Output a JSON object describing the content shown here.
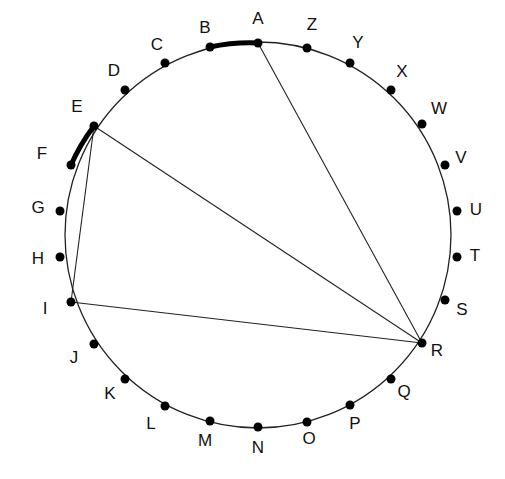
{
  "diagram": {
    "type": "circle-points-chords",
    "circle": {
      "cx": 258,
      "cy": 235,
      "r": 193,
      "stroke": "#222222"
    },
    "points": [
      {
        "label": "A",
        "x": 258,
        "y": 43,
        "lx": 258,
        "ly": 20
      },
      {
        "label": "Z",
        "x": 307,
        "y": 48,
        "lx": 312,
        "ly": 26
      },
      {
        "label": "Y",
        "x": 350,
        "y": 63,
        "lx": 358,
        "ly": 44
      },
      {
        "label": "X",
        "x": 391,
        "y": 90,
        "lx": 402,
        "ly": 73
      },
      {
        "label": "W",
        "x": 422,
        "y": 124,
        "lx": 439,
        "ly": 110
      },
      {
        "label": "V",
        "x": 445,
        "y": 165,
        "lx": 461,
        "ly": 159
      },
      {
        "label": "U",
        "x": 457,
        "y": 211,
        "lx": 476,
        "ly": 211
      },
      {
        "label": "T",
        "x": 457,
        "y": 257,
        "lx": 475,
        "ly": 257
      },
      {
        "label": "S",
        "x": 445,
        "y": 300,
        "lx": 462,
        "ly": 311
      },
      {
        "label": "R",
        "x": 422,
        "y": 343,
        "lx": 437,
        "ly": 352
      },
      {
        "label": "Q",
        "x": 391,
        "y": 379,
        "lx": 404,
        "ly": 393
      },
      {
        "label": "P",
        "x": 350,
        "y": 405,
        "lx": 355,
        "ly": 425
      },
      {
        "label": "O",
        "x": 307,
        "y": 422,
        "lx": 309,
        "ly": 440
      },
      {
        "label": "N",
        "x": 258,
        "y": 427,
        "lx": 258,
        "ly": 449
      },
      {
        "label": "M",
        "x": 210,
        "y": 421,
        "lx": 205,
        "ly": 442
      },
      {
        "label": "L",
        "x": 165,
        "y": 406,
        "lx": 151,
        "ly": 425
      },
      {
        "label": "K",
        "x": 125,
        "y": 379,
        "lx": 110,
        "ly": 395
      },
      {
        "label": "J",
        "x": 94,
        "y": 344,
        "lx": 74,
        "ly": 359
      },
      {
        "label": "I",
        "x": 71,
        "y": 302,
        "lx": 45,
        "ly": 310
      },
      {
        "label": "H",
        "x": 60,
        "y": 257,
        "lx": 38,
        "ly": 260
      },
      {
        "label": "G",
        "x": 60,
        "y": 211,
        "lx": 38,
        "ly": 209
      },
      {
        "label": "F",
        "x": 71,
        "y": 165,
        "lx": 42,
        "ly": 155
      },
      {
        "label": "E",
        "x": 94,
        "y": 126,
        "lx": 77,
        "ly": 108
      },
      {
        "label": "D",
        "x": 125,
        "y": 90,
        "lx": 114,
        "ly": 72
      },
      {
        "label": "C",
        "x": 165,
        "y": 63,
        "lx": 157,
        "ly": 46
      },
      {
        "label": "B",
        "x": 210,
        "y": 47,
        "lx": 205,
        "ly": 29
      }
    ],
    "chords": [
      {
        "from": "A",
        "to": "R"
      },
      {
        "from": "E",
        "to": "R"
      },
      {
        "from": "E",
        "to": "I"
      },
      {
        "from": "I",
        "to": "R"
      }
    ],
    "thick_arcs": [
      {
        "from": "B",
        "to": "A"
      },
      {
        "from": "F",
        "to": "E"
      }
    ]
  }
}
